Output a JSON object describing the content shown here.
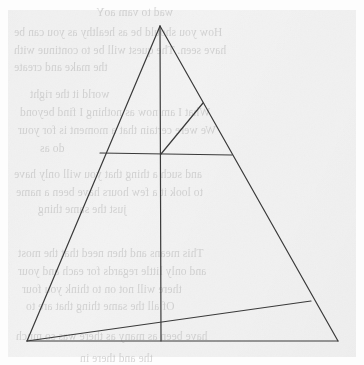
{
  "page": {
    "width": 364,
    "height": 365,
    "background_color": "#fdfdfd",
    "paper_color": "#f3f3f3",
    "ink_color": "#3a3a3a",
    "ghost_text_color": "#b6b6b6"
  },
  "figure": {
    "name": "triangle-with-cevians-diagram",
    "stroke_color": "#3a3a3a",
    "stroke_width": 1.2,
    "points": {
      "apex": {
        "label": "A",
        "x": 160,
        "y": 26
      },
      "bottom_left": {
        "label": "B",
        "x": 27,
        "y": 341
      },
      "bottom_right": {
        "label": "C",
        "x": 338,
        "y": 341
      },
      "centroid": {
        "label": "O",
        "x": 161,
        "y": 154
      },
      "base_midpoint": {
        "label": "M",
        "x": 161,
        "y": 341
      },
      "left_side_point": {
        "label": "D",
        "x": 100,
        "y": 153
      },
      "right_side_point_upper": {
        "label": "E",
        "x": 203,
        "y": 103
      },
      "right_chord_end": {
        "label": "F",
        "x": 232,
        "y": 155
      },
      "right_side_point_lower": {
        "label": "G",
        "x": 311,
        "y": 301
      }
    },
    "segments": [
      {
        "name": "triangle-left-side",
        "from": "apex",
        "to": "bottom_left"
      },
      {
        "name": "triangle-right-side",
        "from": "apex",
        "to": "bottom_right"
      },
      {
        "name": "triangle-base",
        "from": "bottom_left",
        "to": "bottom_right"
      },
      {
        "name": "vertical-median",
        "from": "apex",
        "to": "base_midpoint"
      },
      {
        "name": "horizontal-chord",
        "from": "left_side_point",
        "to": "right_chord_end"
      },
      {
        "name": "cevian-bottomleft-to-right-side",
        "from": "bottom_left",
        "to": "right_side_point_lower"
      },
      {
        "name": "segment-centroid-to-upper-right",
        "from": "centroid",
        "to": "right_side_point_upper"
      }
    ]
  },
  "ghost_text": {
    "note": "Faint show-through text from the reverse side of the page; mirrored and mostly illegible.",
    "lines": [
      {
        "text": "wad to vam aoY",
        "x": 96,
        "y": 6,
        "size": 11.5
      },
      {
        "text": "How you should be as healthy as you can be",
        "x": 14,
        "y": 26,
        "size": 11.5
      },
      {
        "text": "have seen. The quest will be to continue with",
        "x": 14,
        "y": 44,
        "size": 11.5
      },
      {
        "text": "the make and create",
        "x": 14,
        "y": 61,
        "size": 11.5
      },
      {
        "text": "world it the right",
        "x": 30,
        "y": 88,
        "size": 11.5
      },
      {
        "text": "What I am now as nothing I find beyond",
        "x": 20,
        "y": 106,
        "size": 11.5
      },
      {
        "text": "We were certain that a moment is for your",
        "x": 18,
        "y": 124,
        "size": 11.5
      },
      {
        "text": "do as",
        "x": 40,
        "y": 142,
        "size": 11.5
      },
      {
        "text": "and such a thing that you will only have",
        "x": 14,
        "y": 168,
        "size": 11.5
      },
      {
        "text": "to look it a few hours have been a name",
        "x": 16,
        "y": 186,
        "size": 11.5
      },
      {
        "text": "just the same thing",
        "x": 38,
        "y": 203,
        "size": 11.5
      },
      {
        "text": "This means and then need that the most",
        "x": 18,
        "y": 247,
        "size": 11.5
      },
      {
        "text": "and only little regards for each and your",
        "x": 18,
        "y": 265,
        "size": 11.5
      },
      {
        "text": "there will not on to think you four",
        "x": 22,
        "y": 283,
        "size": 11.5
      },
      {
        "text": "Of all the same thing that are to",
        "x": 26,
        "y": 300,
        "size": 11.5
      },
      {
        "text": "have been as many as there was so much",
        "x": 16,
        "y": 330,
        "size": 11.5
      },
      {
        "text": "the and there in",
        "x": 80,
        "y": 352,
        "size": 11.5
      }
    ]
  }
}
